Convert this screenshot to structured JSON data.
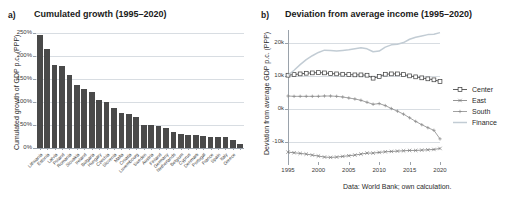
{
  "figure": {
    "caption": "Data: World Bank; own calculation."
  },
  "panel_a": {
    "tag": "a)",
    "title": "Cumulated growth (1995–2020)"
  },
  "panel_b": {
    "tag": "b)",
    "title": "Deviation from average income (1995–2020)"
  },
  "chart_data": [
    {
      "type": "bar",
      "panel": "a",
      "title": "Cumulated growth (1995–2020)",
      "xlabel": "",
      "ylabel": "Cumulated growth of GDP p.c. (PPP)",
      "ylim": [
        0,
        250
      ],
      "yticks": [
        0,
        50,
        100,
        150,
        200,
        250
      ],
      "ytick_labels": [
        "0%",
        "50%",
        "100%",
        "150%",
        "200%",
        "250%"
      ],
      "grid": true,
      "unit": "%",
      "bar_color": "#4a4a4a",
      "categories": [
        "Lithuania",
        "Estonia",
        "Latvia",
        "Poland",
        "Romania",
        "Slovakia",
        "Ireland",
        "Bulgaria",
        "Hungary",
        "Czechia",
        "Slovenia",
        "Malta",
        "Croatia",
        "Luxembourg",
        "Sweden",
        "Austria",
        "Finland",
        "Germany",
        "Netherlands",
        "Belgium",
        "Cyprus",
        "Denmark",
        "Portugal",
        "France",
        "Spain",
        "Italy",
        "Greece"
      ],
      "values": [
        245,
        215,
        181,
        178,
        158,
        136,
        128,
        122,
        104,
        100,
        86,
        77,
        74,
        68,
        50,
        49,
        47,
        43,
        34,
        30,
        29,
        28,
        27,
        25,
        24,
        23,
        18,
        8
      ]
    },
    {
      "type": "line",
      "panel": "b",
      "title": "Deviation from average income (1995–2020)",
      "xlabel": "",
      "ylabel": "Deviation from average GDP p.c. (PPP)",
      "xlim": [
        1995,
        2020
      ],
      "xticks": [
        1995,
        2000,
        2005,
        2010,
        2015,
        2020
      ],
      "xtick_labels": [
        "1995",
        "2000",
        "2005",
        "2010",
        "2015",
        "2020"
      ],
      "ylim": [
        -16000,
        24000
      ],
      "yticks": [
        -10000,
        0,
        10000,
        20000
      ],
      "ytick_labels": [
        "-10k",
        "0k",
        "10k",
        "20k"
      ],
      "grid": true,
      "legend_position": "right",
      "x": [
        1995,
        1996,
        1997,
        1998,
        1999,
        2000,
        2001,
        2002,
        2003,
        2004,
        2005,
        2006,
        2007,
        2008,
        2009,
        2010,
        2011,
        2012,
        2013,
        2014,
        2015,
        2016,
        2017,
        2018,
        2019,
        2020
      ],
      "series": [
        {
          "name": "Center",
          "marker": "square",
          "color": "#3a3a3a",
          "values": [
            10300,
            10500,
            10700,
            10900,
            11000,
            11100,
            11000,
            10800,
            10700,
            10600,
            10500,
            10400,
            10400,
            10300,
            9400,
            9900,
            10600,
            10700,
            10700,
            10500,
            10100,
            9800,
            9500,
            9200,
            8900,
            8400
          ]
        },
        {
          "name": "East",
          "marker": "cross",
          "color": "#7a7a7a",
          "values": [
            -13000,
            -13200,
            -13400,
            -13600,
            -13900,
            -14200,
            -14500,
            -14600,
            -14500,
            -14300,
            -14100,
            -13900,
            -13600,
            -13300,
            -13300,
            -13100,
            -12900,
            -12800,
            -12700,
            -12600,
            -12500,
            -12500,
            -12400,
            -12300,
            -12200,
            -11900
          ]
        },
        {
          "name": "South",
          "marker": "plus",
          "color": "#8a8a8a",
          "values": [
            4000,
            3900,
            3900,
            3900,
            3900,
            3900,
            4000,
            4000,
            3900,
            3700,
            3400,
            3100,
            2700,
            2100,
            1500,
            1700,
            1100,
            200,
            -600,
            -1500,
            -2600,
            -3700,
            -4700,
            -5600,
            -6400,
            -9000
          ]
        },
        {
          "name": "Finance",
          "marker": "none",
          "color": "#c2ccd4",
          "values": [
            10300,
            11800,
            13500,
            15000,
            16200,
            17200,
            17900,
            17800,
            17600,
            17800,
            18000,
            18300,
            18600,
            18300,
            17400,
            17600,
            18800,
            19500,
            19700,
            20200,
            21200,
            21800,
            22200,
            22600,
            22700,
            23200
          ]
        }
      ]
    }
  ]
}
